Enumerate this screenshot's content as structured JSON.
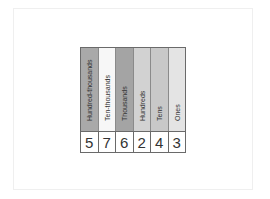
{
  "place_value_chart": {
    "columns": [
      {
        "label": "Hundred-thousands",
        "digit": "5",
        "color": "#a9a9a9"
      },
      {
        "label": "Ten-thousands",
        "digit": "7",
        "color": "#f7f7f7"
      },
      {
        "label": "Thousands",
        "digit": "6",
        "color": "#a4a4a4"
      },
      {
        "label": "Hundreds",
        "digit": "2",
        "color": "#d2d2d2"
      },
      {
        "label": "Tens",
        "digit": "4",
        "color": "#c8c8c8"
      },
      {
        "label": "Ones",
        "digit": "3",
        "color": "#e4e4e4"
      }
    ],
    "number": "576243"
  }
}
